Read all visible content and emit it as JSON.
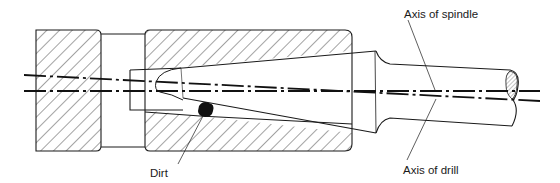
{
  "diagram": {
    "type": "technical-cross-section",
    "labels": {
      "axis_of_spindle": "Axis of spindle",
      "axis_of_drill": "Axis of drill",
      "dirt": "Dirt"
    },
    "colors": {
      "ink": "#1a1a1a",
      "background": "#ffffff",
      "hatch": "#333333"
    },
    "parts": [
      "left-housing-block",
      "spindle-sleeve",
      "taper-shank-drill",
      "dirt-particle",
      "axis-of-spindle-line",
      "axis-of-drill-line"
    ]
  }
}
